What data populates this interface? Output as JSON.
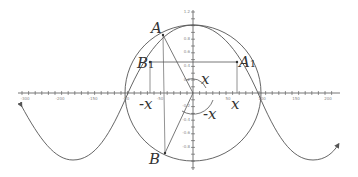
{
  "diagram": {
    "type": "unit-circle-with-cosine-curve",
    "colors": {
      "stroke": "#555555",
      "axis": "#666666",
      "text": "#333333",
      "tick_text": "#888888"
    },
    "x_axis_tick_labels": [
      "-300",
      "-200",
      "-150",
      "-50",
      "50",
      "100",
      "150",
      "200"
    ],
    "y_axis_tick_labels": [
      "1.2",
      "0.8",
      "0.6",
      "0.4",
      "0.2",
      "-0.2",
      "-0.4",
      "-0.6",
      "-0.8",
      "-1"
    ],
    "points": {
      "A": {
        "name": "A",
        "sub": ""
      },
      "A1": {
        "name": "A",
        "sub": "1"
      },
      "B1": {
        "name": "B",
        "sub": "1"
      },
      "B": {
        "name": "B",
        "sub": ""
      }
    },
    "angle_labels": {
      "upper_angle": "x",
      "lower_angle": "-x",
      "axis_pos": "x",
      "axis_neg": "-x"
    }
  }
}
